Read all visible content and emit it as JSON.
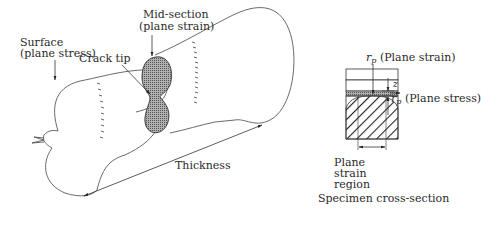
{
  "diagram": {
    "specimen_3d": {
      "labels": {
        "surface_line1": "Surface",
        "surface_line2": "(plane stress)",
        "mid_section_line1": "Mid-section",
        "mid_section_line2": "(plane strain)",
        "crack_tip": "Crack tip",
        "thickness": "Thickness"
      }
    },
    "cross_section": {
      "title": "Specimen cross-section",
      "rp_symbol": "r",
      "rp_subscript": "p",
      "rp_plane_strain": "(Plane strain)",
      "z_label": "z",
      "rp_plane_stress": "(Plane stress)",
      "region_line1": "Plane",
      "region_line2": "strain",
      "region_line3": "region"
    },
    "colors": {
      "line": "#333333",
      "zone_fill": "#9a9a9a",
      "hatch": "#222222"
    }
  }
}
